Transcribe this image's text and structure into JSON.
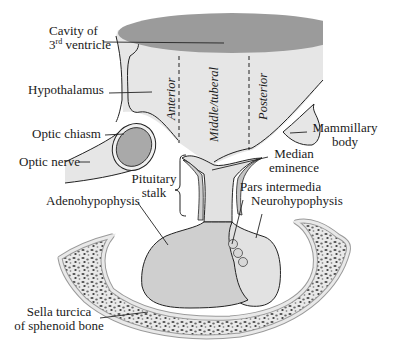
{
  "diagram": {
    "colors": {
      "ventricle": "#9a9a9a",
      "brain_tissue": "#e6e6e6",
      "optic_chiasm": "#a8a8a8",
      "adenohypophysis": "#cfcfcf",
      "neurohypophysis": "#e2e2e2",
      "pars_intermedia": "#c4c4c4",
      "bone_fill": "#e8e8e8",
      "bone_spots": "#555555",
      "outline": "#222222"
    },
    "labels": {
      "cavity_line1": "Cavity of",
      "cavity_line2_prefix": "3",
      "cavity_line2_sup": "rd",
      "cavity_line2_suffix": " ventricle",
      "hypothalamus": "Hypothalamus",
      "optic_chiasm": "Optic chiasm",
      "optic_nerve": "Optic nerve",
      "pituitary_stalk_line1": "Pituitary",
      "pituitary_stalk_line2": "stalk",
      "adenohypophysis": "Adenohypophysis",
      "mammillary_line1": "Mammillary",
      "mammillary_line2": "body",
      "median_line1": "Median",
      "median_line2": "eminence",
      "pars_intermedia": "Pars intermedia",
      "neurohypophysis": "Neurohypophysis",
      "sella_line1": "Sella turcica",
      "sella_line2": "of sphenoid bone"
    },
    "regions": {
      "anterior": "Anterior",
      "middle": "Middle/tuberal",
      "posterior": "Posterior"
    }
  }
}
